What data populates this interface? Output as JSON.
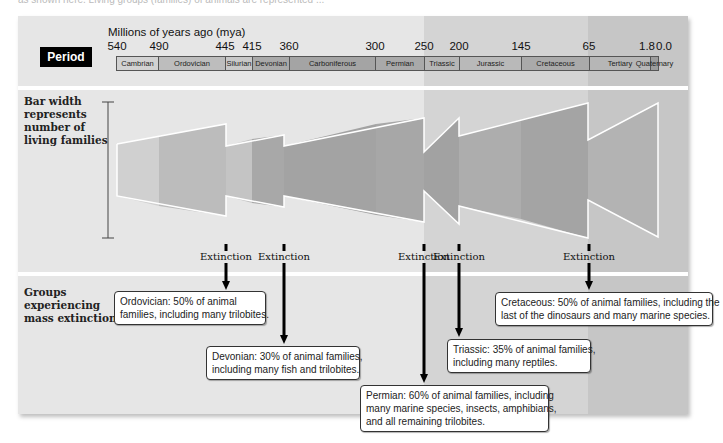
{
  "header_fragment": "as shown here. Living groups (families) of animals are represented ...",
  "timeline": {
    "row_label": "Period",
    "axis_title": "Millions of years ago (mya)",
    "ticks": [
      {
        "label": "540",
        "x": 117
      },
      {
        "label": "490",
        "x": 159
      },
      {
        "label": "445",
        "x": 225
      },
      {
        "label": "415",
        "x": 252
      },
      {
        "label": "360",
        "x": 289
      },
      {
        "label": "300",
        "x": 375
      },
      {
        "label": "250",
        "x": 424
      },
      {
        "label": "200",
        "x": 459
      },
      {
        "label": "145",
        "x": 521
      },
      {
        "label": "65",
        "x": 589
      },
      {
        "label": "1.8",
        "x": 650
      },
      {
        "label": "0.0",
        "x": 658
      }
    ],
    "periods": [
      {
        "name": "Cambrian",
        "x": 116,
        "w": 42,
        "color": "#d2d2d2"
      },
      {
        "name": "Ordovician",
        "x": 158,
        "w": 67,
        "color": "#bdbdbd"
      },
      {
        "name": "Silurian",
        "x": 225,
        "w": 27,
        "color": "#c8c8c8"
      },
      {
        "name": "Devonian",
        "x": 252,
        "w": 37,
        "color": "#a9a9a9"
      },
      {
        "name": "Carboniferous",
        "x": 289,
        "w": 86,
        "color": "#a4a4a4"
      },
      {
        "name": "Permian",
        "x": 375,
        "w": 49,
        "color": "#a9a9a9"
      },
      {
        "name": "Triassic",
        "x": 424,
        "w": 35,
        "color": "#b6b6b6"
      },
      {
        "name": "Jurassic",
        "x": 459,
        "w": 62,
        "color": "#b9b9b9"
      },
      {
        "name": "Cretaceous",
        "x": 521,
        "w": 68,
        "color": "#aaaaaa"
      },
      {
        "name": "Tertiary",
        "x": 589,
        "w": 61,
        "color": "#b6b6b6"
      },
      {
        "name": "Quaternary",
        "x": 650,
        "w": 8,
        "color": "#9c9c9c"
      }
    ]
  },
  "families_section": {
    "label_lines": [
      "Bar width",
      "represents",
      "number of",
      "living families"
    ]
  },
  "extinctions_section": {
    "label_lines": [
      "Groups",
      "experiencing",
      "mass extinction"
    ],
    "events": [
      {
        "label": "Extinction",
        "x": 226,
        "period": "Ordovician",
        "text_lines": [
          "Ordovician: 50% of animal",
          "families, including many trilobites."
        ],
        "box": {
          "x": 114,
          "y": 291,
          "w": 152
        },
        "arrow_end": 290
      },
      {
        "label": "Extinction",
        "x": 284,
        "period": "Devonian",
        "text_lines": [
          "Devonian: 30% of animal families,",
          "including many fish and trilobites."
        ],
        "box": {
          "x": 206,
          "y": 346,
          "w": 154
        },
        "arrow_end": 344
      },
      {
        "label": "Extinction",
        "x": 424,
        "period": "Permian",
        "text_lines": [
          "Permian: 60% of animal families, including",
          "many marine species, insects, amphibians,",
          "and all remaining trilobites."
        ],
        "box": {
          "x": 360,
          "y": 385,
          "w": 189
        },
        "arrow_end": 383
      },
      {
        "label": "Extinction",
        "x": 459,
        "period": "Triassic",
        "text_lines": [
          "Triassic: 35% of animal families,",
          "including many reptiles."
        ],
        "box": {
          "x": 447,
          "y": 339,
          "w": 144
        },
        "arrow_end": 337
      },
      {
        "label": "Extinction",
        "x": 589,
        "period": "Cretaceous",
        "text_lines": [
          "Cretaceous: 50% of animal families, including the",
          "last of the dinosaurs and many marine species."
        ],
        "box": {
          "x": 495,
          "y": 292,
          "w": 218
        },
        "arrow_end": 290
      }
    ]
  },
  "colors": {
    "panel_paleozoic": "#e6e6e6",
    "panel_mesozoic": "#d4d4d4",
    "panel_cenozoic": "#c6c6c6",
    "bar_outline": "#ffffff"
  }
}
